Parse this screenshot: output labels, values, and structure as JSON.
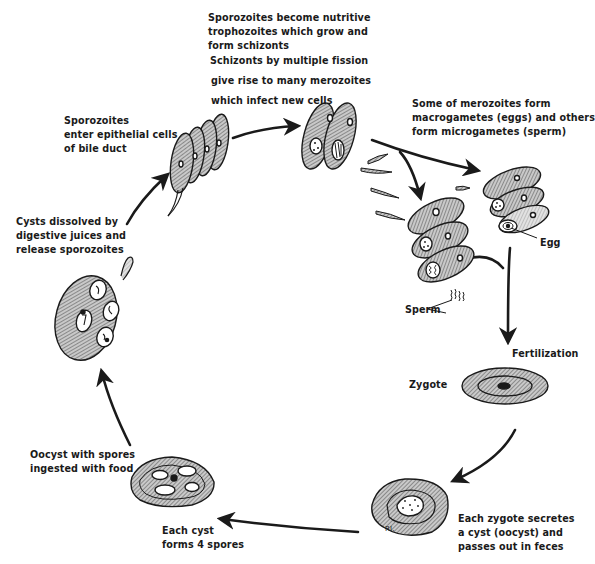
{
  "diagram": {
    "title": "",
    "type": "life-cycle",
    "colors": {
      "ink": "#1a1a1a",
      "hatch": "#8a8a8a",
      "paper": "#ffffff"
    }
  },
  "labels": {
    "schizonts": {
      "lines": [
        "Sporozoites become nutritive",
        "trophozoites which grow and",
        "form schizonts",
        "Schizonts by multiple fission",
        "give rise to many merozoites",
        "which infect new cells"
      ]
    },
    "sporozoites_enter": {
      "lines": [
        "Sporozoites",
        "enter epithelial cells",
        "of bile duct"
      ]
    },
    "gametes": {
      "lines": [
        "Some of merozoites form",
        "macrogametes (eggs) and others",
        "form microgametes (sperm)"
      ]
    },
    "egg": "Egg",
    "sperm": "Sperm",
    "cysts_dissolved": {
      "lines": [
        "Cysts dissolved by",
        "digestive juices and",
        "release sporozoites"
      ]
    },
    "fertilization": "Fertilization",
    "zygote": "Zygote",
    "oocyst_ingested": {
      "lines": [
        "Oocyst with spores",
        "ingested with food"
      ]
    },
    "each_cyst": {
      "lines": [
        "Each cyst",
        "forms 4 spores"
      ]
    },
    "each_zygote": {
      "lines": [
        "Each zygote secretes",
        "a cyst (oocyst) and",
        "passes out in feces"
      ]
    },
    "signature": "RI."
  },
  "stages": [
    {
      "id": "epithelial-cells",
      "name": "Sporozoites enter epithelial cells"
    },
    {
      "id": "schizont-cells",
      "name": "Trophozoites / schizonts"
    },
    {
      "id": "merozoites",
      "name": "Merozoites"
    },
    {
      "id": "sperm-cells",
      "name": "Microgametes (sperm)"
    },
    {
      "id": "egg-cells",
      "name": "Macrogametes (eggs)"
    },
    {
      "id": "zygote",
      "name": "Zygote"
    },
    {
      "id": "oocyst",
      "name": "Oocyst passed in feces"
    },
    {
      "id": "spore-cyst",
      "name": "Cyst with 4 spores"
    },
    {
      "id": "dissolving-cyst",
      "name": "Cyst releasing sporozoites"
    }
  ]
}
